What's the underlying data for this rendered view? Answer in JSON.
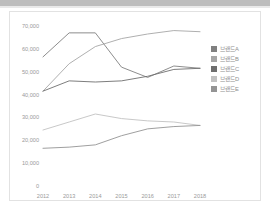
{
  "window": {
    "top_strip_color": "#bdbdbd",
    "panel_background": "#ffffff",
    "panel_border_color": "#e2e2e2"
  },
  "legend": {
    "position": "right",
    "items": [
      {
        "label": "브랜드A",
        "color": "#808080",
        "swatch_name": "legend-swatch-brand-a"
      },
      {
        "label": "브랜드B",
        "color": "#a6a6a6",
        "swatch_name": "legend-swatch-brand-b"
      },
      {
        "label": "브랜드C",
        "color": "#6e6e6e",
        "swatch_name": "legend-swatch-brand-c"
      },
      {
        "label": "브랜드D",
        "color": "#c2c2c2",
        "swatch_name": "legend-swatch-brand-d"
      },
      {
        "label": "브랜드E",
        "color": "#949494",
        "swatch_name": "legend-swatch-brand-e"
      }
    ]
  },
  "axis": {
    "y_tick_labels": [
      "70,000",
      "60,000",
      "50,000",
      "40,000",
      "30,000",
      "20,000",
      "10,000",
      "0"
    ],
    "x_tick_labels": [
      "2012",
      "2013",
      "2014",
      "2015",
      "2016",
      "2017",
      "2018"
    ],
    "tick_color": "#9a9a9a"
  },
  "chart_data": {
    "type": "line",
    "title": "",
    "subtitle": "",
    "xlabel": "",
    "ylabel": "",
    "x": [
      2012,
      2013,
      2014,
      2015,
      2016,
      2017,
      2018
    ],
    "categories": [
      "2012",
      "2013",
      "2014",
      "2015",
      "2016",
      "2017",
      "2018"
    ],
    "ylim": [
      0,
      70000
    ],
    "ytick_values": [
      0,
      10000,
      20000,
      30000,
      40000,
      50000,
      60000,
      70000
    ],
    "grid": false,
    "legend_position": "right",
    "series": [
      {
        "name": "브랜드A",
        "color": "#808080",
        "values": [
          56500,
          67000,
          67000,
          52000,
          47500,
          52500,
          51500
        ]
      },
      {
        "name": "브랜드B",
        "color": "#a6a6a6",
        "values": [
          41500,
          53500,
          61000,
          64500,
          66500,
          68000,
          67500
        ]
      },
      {
        "name": "브랜드C",
        "color": "#6e6e6e",
        "values": [
          41500,
          46000,
          45500,
          46000,
          48000,
          51000,
          51500
        ]
      },
      {
        "name": "브랜드D",
        "color": "#c2c2c2",
        "values": [
          24500,
          28000,
          31500,
          29500,
          28500,
          28000,
          26500
        ]
      },
      {
        "name": "브랜드E",
        "color": "#949494",
        "values": [
          16500,
          17000,
          18000,
          22000,
          25000,
          26000,
          26500
        ]
      }
    ]
  }
}
